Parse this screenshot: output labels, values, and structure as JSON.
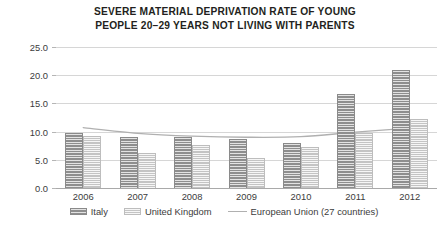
{
  "chart_data": {
    "type": "bar",
    "title": "SEVERE MATERIAL DEPRIVATION RATE OF YOUNG\nPEOPLE  20–29 YEARS NOT LIVING WITH PARENTS",
    "xlabel": "",
    "ylabel": "",
    "categories": [
      "2006",
      "2007",
      "2008",
      "2009",
      "2010",
      "2011",
      "2012"
    ],
    "ylim": [
      0.0,
      25.0
    ],
    "ytick_labels": [
      "0.0",
      "5.0",
      "10.0",
      "15.0",
      "20.0",
      "25.0"
    ],
    "ytick_values": [
      0.0,
      5.0,
      10.0,
      15.0,
      20.0,
      25.0
    ],
    "grid": true,
    "legend_position": "bottom",
    "series": [
      {
        "name": "Italy",
        "kind": "bar",
        "color": "#8e8e8e",
        "values": [
          9.8,
          9.0,
          9.0,
          8.7,
          7.9,
          16.7,
          21.0
        ]
      },
      {
        "name": "United Kingdom",
        "kind": "bar",
        "color": "#c4c4c4",
        "values": [
          9.3,
          6.2,
          7.7,
          5.4,
          7.3,
          9.8,
          12.3
        ]
      },
      {
        "name": "European Union (27 countries)",
        "kind": "line",
        "color": "#b0b0b0",
        "values": [
          10.7,
          9.7,
          9.2,
          9.0,
          9.1,
          9.9,
          10.6
        ]
      }
    ]
  },
  "legend": {
    "items": [
      {
        "label": "Italy",
        "swatch": "bar-dark-swatch"
      },
      {
        "label": "United Kingdom",
        "swatch": "bar-light-swatch"
      },
      {
        "label": "European Union (27 countries)",
        "swatch": "line-swatch"
      }
    ]
  }
}
